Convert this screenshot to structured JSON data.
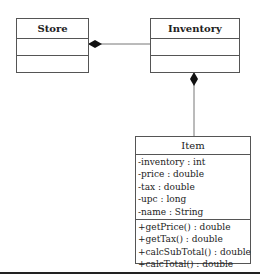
{
  "diagram_type": "UML class diagram",
  "classes": [
    {
      "name": "Store",
      "attributes": [],
      "methods": []
    },
    {
      "name": "Inventory",
      "attributes": [],
      "methods": []
    },
    {
      "name": "Item",
      "attributes": [
        "-inventory : int",
        "-price : double",
        "-tax : double",
        "-upc : long",
        "-name : String"
      ],
      "methods": [
        "+getPrice() : double",
        "+getTax() : double",
        "+calcSubTotal() : double",
        "+calcTotal() : double"
      ]
    }
  ],
  "relationships": [
    {
      "type": "composition",
      "whole": "Store",
      "part": "Inventory"
    },
    {
      "type": "composition",
      "whole": "Inventory",
      "part": "Item"
    }
  ],
  "colors": {
    "line": "#555555",
    "diamond": "#111111"
  }
}
